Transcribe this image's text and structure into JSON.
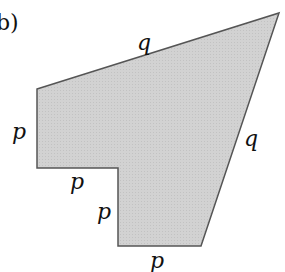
{
  "figure": {
    "part_label": "b)",
    "shape_fill": "#d4d4d4",
    "shape_stroke": "#555555",
    "labels": {
      "top_edge": "q",
      "left_edge": "p",
      "notch_horizontal": "p",
      "notch_vertical": "p",
      "bottom_edge": "p",
      "right_edge": "q"
    }
  }
}
